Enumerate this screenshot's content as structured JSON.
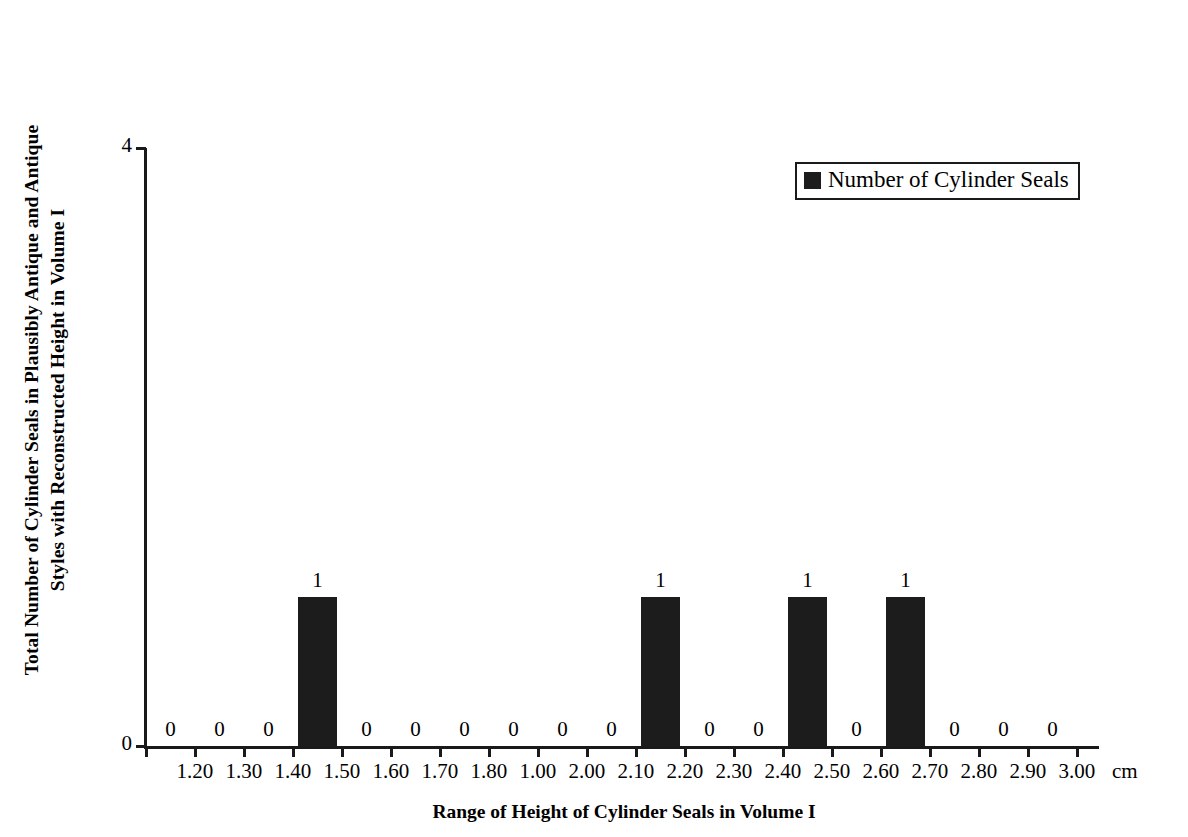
{
  "chart_data": {
    "type": "bar",
    "title": "",
    "xlabel": "Range of Height of Cylinder Seals in Volume I",
    "ylabel": "Total Number of Cylinder Seals in Plausibly Antique and Antique Styles with Reconstructed Height in Volume I",
    "ylabel_lines": [
      "Total Number of Cylinder Seals in Plausibly Antique and Antique",
      "Styles with Reconstructed Height in Volume I"
    ],
    "x_unit": "cm",
    "categories": [
      "1.20",
      "1.30",
      "1.40",
      "1.50",
      "1.60",
      "1.70",
      "1.80",
      "1.00",
      "2.00",
      "2.10",
      "2.20",
      "2.30",
      "2.40",
      "2.50",
      "2.60",
      "2.70",
      "2.80",
      "2.90",
      "3.00"
    ],
    "values": [
      0,
      0,
      0,
      1,
      0,
      0,
      0,
      0,
      0,
      0,
      1,
      0,
      0,
      1,
      0,
      1,
      0,
      0,
      0
    ],
    "data_labels": [
      "0",
      "0",
      "0",
      "1",
      "0",
      "0",
      "0",
      "0",
      "0",
      "0",
      "1",
      "0",
      "0",
      "1",
      "0",
      "1",
      "0",
      "0",
      "0"
    ],
    "ylim": [
      0,
      4
    ],
    "y_ticks": [
      "0",
      "4"
    ],
    "y_tick_values": [
      0,
      4
    ],
    "grid": false,
    "legend_position": "top-right",
    "series": [
      {
        "name": "Number of Cylinder Seals",
        "color": "#1c1c1c",
        "values": [
          0,
          0,
          0,
          1,
          0,
          0,
          0,
          0,
          0,
          0,
          1,
          0,
          0,
          1,
          0,
          1,
          0,
          0,
          0
        ]
      }
    ]
  },
  "legend": {
    "entries": [
      {
        "label": "Number of Cylinder Seals",
        "color": "#1c1c1c",
        "marker": "filled-square"
      }
    ]
  },
  "colors": {
    "bar": "#1c1c1c",
    "axis": "#1a1a1a",
    "text": "#000000",
    "background": "#ffffff"
  }
}
